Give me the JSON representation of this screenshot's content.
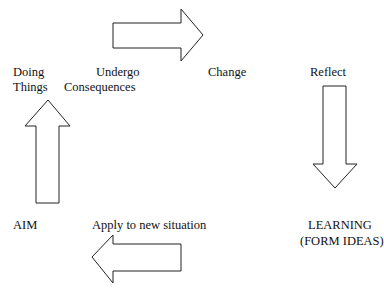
{
  "diagram": {
    "type": "learning-cycle",
    "nodes": {
      "doing_things": {
        "line1": "Doing",
        "line2": "Things"
      },
      "undergo_consequences": {
        "line1": "Undergo",
        "line2": "Consequences"
      },
      "change": {
        "label": "Change"
      },
      "reflect": {
        "label": "Reflect"
      },
      "learning": {
        "line1": "LEARNING",
        "line2": "(FORM IDEAS)"
      },
      "apply": {
        "label": "Apply to new situation"
      },
      "aim": {
        "label": "AIM"
      }
    },
    "arrows": [
      {
        "direction": "right",
        "from": "Undergo Consequences",
        "to": "Change"
      },
      {
        "direction": "down",
        "from": "Reflect",
        "to": "LEARNING (FORM IDEAS)"
      },
      {
        "direction": "left",
        "from": "Apply to new situation",
        "to": "AIM"
      },
      {
        "direction": "up",
        "from": "AIM",
        "to": "Doing Things"
      }
    ]
  }
}
